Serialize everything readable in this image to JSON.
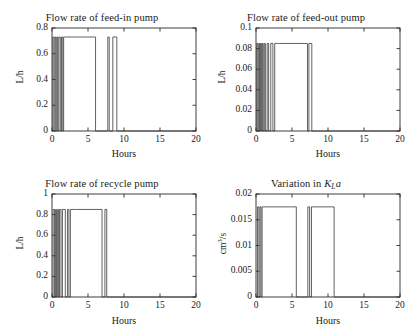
{
  "figure": {
    "background": "#ffffff",
    "line_color": "#3a3a3a",
    "axis_color": "#2b2b2b"
  },
  "chart_data": [
    {
      "type": "line",
      "panel": "top-left",
      "title": "Flow rate of feed-in pump",
      "xlabel": "Hours",
      "ylabel": "L/h",
      "xlim": [
        0,
        20
      ],
      "ylim": [
        0,
        0.8
      ],
      "xticks": [
        0,
        5,
        10,
        15,
        20
      ],
      "yticks": [
        0,
        0.2,
        0.4,
        0.6,
        0.8
      ],
      "xticklabels": [
        "0",
        "5",
        "10",
        "15",
        "20"
      ],
      "yticklabels": [
        "0",
        "0.2",
        "0.4",
        "0.6",
        "0.8"
      ],
      "grid": false,
      "legend": null,
      "high_level": 0.73,
      "low_level": 0,
      "series": [
        {
          "name": "feed-in flow",
          "x": [
            0,
            0.12,
            0.12,
            0.28,
            0.28,
            0.42,
            0.42,
            0.55,
            0.55,
            0.68,
            0.68,
            0.8,
            0.8,
            0.95,
            0.95,
            1.15,
            1.15,
            1.32,
            1.32,
            1.5,
            1.5,
            1.62,
            1.62,
            1.78,
            1.78,
            6.05,
            6.05,
            7.75,
            7.75,
            7.95,
            7.95,
            8.45,
            8.45,
            9.0,
            9.0,
            20
          ],
          "y": [
            0,
            0,
            0.73,
            0.73,
            0,
            0,
            0.73,
            0.73,
            0,
            0,
            0.73,
            0.73,
            0,
            0,
            0.73,
            0.73,
            0,
            0,
            0.73,
            0.73,
            0,
            0,
            0.73,
            0.73,
            0.73,
            0.73,
            0,
            0,
            0.73,
            0.73,
            0,
            0,
            0.73,
            0.73,
            0,
            0
          ]
        }
      ]
    },
    {
      "type": "line",
      "panel": "top-right",
      "title": "Flow rate of feed-out pump",
      "xlabel": "Hours",
      "ylabel": "L/h",
      "xlim": [
        0,
        20
      ],
      "ylim": [
        0,
        0.1
      ],
      "xticks": [
        0,
        5,
        10,
        15,
        20
      ],
      "yticks": [
        0,
        0.02,
        0.04,
        0.06,
        0.08,
        0.1
      ],
      "xticklabels": [
        "0",
        "5",
        "10",
        "15",
        "20"
      ],
      "yticklabels": [
        "0",
        "0.02",
        "0.04",
        "0.06",
        "0.08",
        "0.1"
      ],
      "grid": false,
      "legend": null,
      "high_level": 0.085,
      "low_level": 0,
      "series": [
        {
          "name": "feed-out flow",
          "x": [
            0,
            0.1,
            0.1,
            0.25,
            0.25,
            0.38,
            0.38,
            0.5,
            0.5,
            0.62,
            0.62,
            0.75,
            0.75,
            0.88,
            0.88,
            1.0,
            1.0,
            1.15,
            1.15,
            1.3,
            1.3,
            1.55,
            1.55,
            1.75,
            1.75,
            2.05,
            2.05,
            2.35,
            2.35,
            2.6,
            2.6,
            3.0,
            3.0,
            3.3,
            3.3,
            7.15,
            7.15,
            7.35,
            7.35,
            7.75,
            7.75,
            20
          ],
          "y": [
            0,
            0,
            0.085,
            0.085,
            0,
            0,
            0.085,
            0.085,
            0,
            0,
            0.085,
            0.085,
            0,
            0,
            0.085,
            0.085,
            0,
            0,
            0.085,
            0.085,
            0,
            0,
            0.085,
            0.085,
            0,
            0,
            0.085,
            0.085,
            0,
            0,
            0.085,
            0.085,
            0.085,
            0.085,
            0.085,
            0.085,
            0,
            0,
            0.085,
            0.085,
            0,
            0
          ]
        }
      ]
    },
    {
      "type": "line",
      "panel": "bottom-left",
      "title": "Flow rate of recycle pump",
      "xlabel": "Hours",
      "ylabel": "L/h",
      "xlim": [
        0,
        20
      ],
      "ylim": [
        0,
        1
      ],
      "xticks": [
        0,
        5,
        10,
        15,
        20
      ],
      "yticks": [
        0,
        0.2,
        0.4,
        0.6,
        0.8,
        1
      ],
      "xticklabels": [
        "0",
        "5",
        "10",
        "15",
        "20"
      ],
      "yticklabels": [
        "0",
        "0.2",
        "0.4",
        "0.6",
        "0.8",
        "1"
      ],
      "grid": false,
      "legend": null,
      "high_level": 0.85,
      "low_level": 0,
      "series": [
        {
          "name": "recycle flow",
          "x": [
            0,
            0.15,
            0.15,
            0.35,
            0.35,
            0.5,
            0.5,
            0.62,
            0.62,
            0.78,
            0.78,
            0.92,
            0.92,
            1.05,
            1.05,
            1.25,
            1.25,
            1.45,
            1.45,
            1.85,
            1.85,
            2.15,
            2.15,
            2.35,
            2.35,
            2.55,
            2.55,
            3.25,
            3.25,
            6.95,
            6.95,
            7.35,
            7.35,
            7.6,
            7.6,
            7.95,
            7.95,
            20
          ],
          "y": [
            0,
            0,
            0.85,
            0.85,
            0,
            0,
            0.85,
            0.85,
            0,
            0,
            0.85,
            0.85,
            0,
            0,
            0.85,
            0.85,
            0,
            0,
            0.85,
            0.85,
            0,
            0,
            0.85,
            0.85,
            0,
            0,
            0.85,
            0.85,
            0.85,
            0.85,
            0,
            0,
            0.85,
            0.85,
            0,
            0,
            0,
            0
          ]
        }
      ]
    },
    {
      "type": "line",
      "panel": "bottom-right",
      "title_prefix": "Variation in ",
      "title_symbol_main": "K",
      "title_symbol_sub": "L",
      "title_symbol_tail": "a",
      "title": "Variation in KLa",
      "xlabel": "Hours",
      "ylabel": "cm3/s",
      "ylabel_base": "cm",
      "ylabel_exp": "3",
      "ylabel_tail": "/s",
      "xlim": [
        0,
        20
      ],
      "ylim": [
        0,
        0.02
      ],
      "xticks": [
        0,
        5,
        10,
        15,
        20
      ],
      "yticks": [
        0,
        0.005,
        0.01,
        0.015,
        0.02
      ],
      "xticklabels": [
        "0",
        "5",
        "10",
        "15",
        "20"
      ],
      "yticklabels": [
        "0",
        "0.005",
        "0.01",
        "0.015",
        "0.02"
      ],
      "grid": false,
      "legend": null,
      "high_level": 0.0175,
      "low_level": 0,
      "series": [
        {
          "name": "KLa",
          "x": [
            0,
            0.2,
            0.2,
            0.4,
            0.4,
            0.55,
            0.55,
            0.7,
            0.7,
            0.85,
            0.85,
            1.0,
            1.0,
            5.6,
            5.6,
            7.2,
            7.2,
            7.45,
            7.45,
            7.7,
            7.7,
            10.85,
            10.85,
            20
          ],
          "y": [
            0,
            0,
            0.0175,
            0.0175,
            0,
            0,
            0.0175,
            0.0175,
            0,
            0,
            0.0175,
            0.0175,
            0.0175,
            0.0175,
            0,
            0,
            0.0175,
            0.0175,
            0,
            0,
            0.0175,
            0.0175,
            0,
            0
          ]
        }
      ]
    }
  ]
}
